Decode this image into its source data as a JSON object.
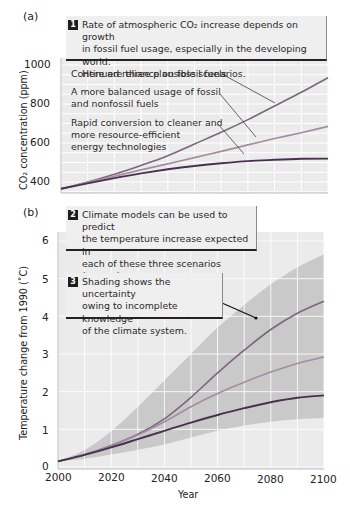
{
  "panel_a": {
    "label": "(a)",
    "callout": {
      "number": "1",
      "lines": [
        "Rate of atmospheric CO₂ increase depends on growth",
        "in fossil fuel usage, especially in the developing world.",
        "Here are three plausible scenarios."
      ]
    },
    "annotations": [
      {
        "lines": [
          "Continued reliance on fossil fuels"
        ]
      },
      {
        "lines": [
          "A more balanced usage of  fossil",
          "and nonfossil fuels"
        ]
      },
      {
        "lines": [
          "Rapid conversion to cleaner and",
          "more resource-efficient",
          "energy technologies"
        ]
      }
    ],
    "y_axis_label": "CO₂ concentration (ppm)",
    "y_ticks": [
      "1000",
      "800",
      "600",
      "400"
    ]
  },
  "panel_b": {
    "label": "(b)",
    "callout_2": {
      "number": "2",
      "lines": [
        "Climate models can be used to predict",
        "the temperature increase expected in",
        "each of these three scenarios (curves)."
      ]
    },
    "callout_3": {
      "number": "3",
      "lines": [
        "Shading shows the uncertainty",
        "owing to incomplete knowledge",
        "of the climate system."
      ]
    },
    "y_axis_label": "Temperature change from 1990 (˚C)",
    "y_ticks": [
      "6",
      "5",
      "4",
      "3",
      "2",
      "1",
      "0"
    ],
    "x_ticks": [
      "2000",
      "2020",
      "2040",
      "2060",
      "2080",
      "2100"
    ],
    "x_axis_label": "Year"
  },
  "colors": {
    "plot_bg": "#ebebeb",
    "grid": "#ffffff",
    "shade": "#c9c9c9",
    "curve_high": "#7d6580",
    "curve_mid": "#a48ca3",
    "curve_low": "#4a3050",
    "callout_bg": "#efefef"
  },
  "chart_data": [
    {
      "type": "line",
      "title": "Rate of atmospheric CO2 increase depends on growth in fossil fuel usage, especially in the developing world. Here are three plausible scenarios.",
      "xlabel": "Year",
      "ylabel": "CO2 concentration (ppm)",
      "x": [
        2000,
        2010,
        2020,
        2030,
        2040,
        2050,
        2060,
        2070,
        2080,
        2090,
        2100
      ],
      "xlim": [
        2000,
        2100
      ],
      "ylim": [
        350,
        1000
      ],
      "grid": true,
      "series": [
        {
          "name": "Continued reliance on fossil fuels",
          "values": [
            365,
            400,
            440,
            485,
            535,
            595,
            655,
            720,
            790,
            860,
            935
          ]
        },
        {
          "name": "A more balanced usage of fossil and nonfossil fuels",
          "values": [
            365,
            398,
            430,
            462,
            493,
            525,
            557,
            590,
            623,
            653,
            685
          ]
        },
        {
          "name": "Rapid conversion to cleaner and more resource-efficient energy technologies",
          "values": [
            365,
            393,
            420,
            444,
            465,
            482,
            496,
            507,
            514,
            519,
            520
          ]
        }
      ]
    },
    {
      "type": "line",
      "title": "Climate models can be used to predict the temperature increase expected in each of these three scenarios (curves).",
      "xlabel": "Year",
      "ylabel": "Temperature change from 1990 (°C)",
      "x": [
        2000,
        2010,
        2020,
        2030,
        2040,
        2050,
        2060,
        2070,
        2080,
        2090,
        2100
      ],
      "xlim": [
        2000,
        2100
      ],
      "ylim": [
        0,
        6
      ],
      "grid": true,
      "series": [
        {
          "name": "Continued reliance on fossil fuels",
          "values": [
            0.15,
            0.33,
            0.57,
            0.87,
            1.28,
            1.85,
            2.5,
            3.1,
            3.65,
            4.08,
            4.4
          ]
        },
        {
          "name": "A more balanced usage of fossil and nonfossil fuels",
          "values": [
            0.15,
            0.33,
            0.56,
            0.85,
            1.2,
            1.6,
            1.95,
            2.25,
            2.52,
            2.75,
            2.92
          ]
        },
        {
          "name": "Rapid conversion to cleaner and more resource-efficient energy technologies",
          "values": [
            0.15,
            0.32,
            0.52,
            0.74,
            0.96,
            1.18,
            1.38,
            1.56,
            1.72,
            1.84,
            1.9
          ]
        }
      ],
      "uncertainty_band": {
        "upper": [
          0.15,
          0.45,
          0.95,
          1.6,
          2.3,
          3.0,
          3.7,
          4.3,
          4.85,
          5.3,
          5.65
        ],
        "lower": [
          0.15,
          0.22,
          0.33,
          0.46,
          0.6,
          0.78,
          0.96,
          1.1,
          1.2,
          1.27,
          1.3
        ]
      },
      "annotations": [
        "Shading shows the uncertainty owing to incomplete knowledge of the climate system."
      ]
    }
  ]
}
